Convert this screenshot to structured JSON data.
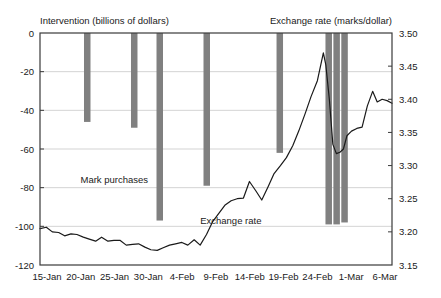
{
  "chart_data": {
    "type": "bar",
    "title": "",
    "left_axis": {
      "label": "Intervention (billions of dollars)",
      "ticks": [
        "0",
        "-20",
        "-40",
        "-60",
        "-80",
        "-100",
        "-120"
      ],
      "tick_values": [
        0,
        -20,
        -40,
        -60,
        -80,
        -100,
        -120
      ],
      "ylim": [
        -120,
        0
      ],
      "units": "billions of dollars"
    },
    "right_axis": {
      "label": "Exchange rate (marks/dollar)",
      "ticks": [
        "3.50",
        "3.45",
        "3.40",
        "3.35",
        "3.30",
        "3.25",
        "3.20",
        "3.15"
      ],
      "tick_values": [
        3.5,
        3.45,
        3.4,
        3.35,
        3.3,
        3.25,
        3.2,
        3.15
      ],
      "ylim": [
        3.15,
        3.5
      ],
      "units": "marks/dollar"
    },
    "xlabel": "",
    "x_ticks": [
      "15-Jan",
      "20-Jan",
      "25-Jan",
      "30-Jan",
      "4-Feb",
      "9-Feb",
      "14-Feb",
      "19-Feb",
      "24-Feb",
      "1-Mar",
      "6-Mar"
    ],
    "grid": true,
    "legend_position": "inline-annotations",
    "annotations": [
      {
        "text": "Mark purchases",
        "x_frac": 0.115,
        "y_frac": 0.645
      },
      {
        "text": "Exchange rate",
        "x_frac": 0.455,
        "y_frac": 0.825
      }
    ],
    "series": [
      {
        "name": "Mark purchases",
        "type": "bar",
        "axis": "left",
        "color": "#808080",
        "bars": [
          {
            "date": "19-Jan",
            "x_frac": 0.1335,
            "value": -46
          },
          {
            "date": "25-Jan",
            "x_frac": 0.267,
            "value": -49
          },
          {
            "date": "28-Jan",
            "x_frac": 0.3395,
            "value": -97
          },
          {
            "date": "3-Feb",
            "x_frac": 0.473,
            "value": -79
          },
          {
            "date": "18-Feb",
            "x_frac": 0.6805,
            "value": -62
          },
          {
            "date": "27-Feb",
            "x_frac": 0.8195,
            "value": -99
          },
          {
            "date": "28-Feb",
            "x_frac": 0.842,
            "value": -99
          },
          {
            "date": "1-Mar",
            "x_frac": 0.8645,
            "value": -98
          }
        ]
      },
      {
        "name": "Exchange rate",
        "type": "line",
        "axis": "right",
        "color": "#1a1a1a",
        "points": [
          {
            "x_frac": 0.0,
            "value": 3.205
          },
          {
            "x_frac": 0.018,
            "value": 3.207
          },
          {
            "x_frac": 0.035,
            "value": 3.2
          },
          {
            "x_frac": 0.053,
            "value": 3.199
          },
          {
            "x_frac": 0.07,
            "value": 3.194
          },
          {
            "x_frac": 0.088,
            "value": 3.197
          },
          {
            "x_frac": 0.105,
            "value": 3.196
          },
          {
            "x_frac": 0.123,
            "value": 3.192
          },
          {
            "x_frac": 0.14,
            "value": 3.189
          },
          {
            "x_frac": 0.158,
            "value": 3.186
          },
          {
            "x_frac": 0.175,
            "value": 3.192
          },
          {
            "x_frac": 0.193,
            "value": 3.186
          },
          {
            "x_frac": 0.21,
            "value": 3.187
          },
          {
            "x_frac": 0.228,
            "value": 3.187
          },
          {
            "x_frac": 0.245,
            "value": 3.18
          },
          {
            "x_frac": 0.263,
            "value": 3.181
          },
          {
            "x_frac": 0.28,
            "value": 3.182
          },
          {
            "x_frac": 0.298,
            "value": 3.177
          },
          {
            "x_frac": 0.315,
            "value": 3.173
          },
          {
            "x_frac": 0.333,
            "value": 3.172
          },
          {
            "x_frac": 0.35,
            "value": 3.176
          },
          {
            "x_frac": 0.368,
            "value": 3.18
          },
          {
            "x_frac": 0.385,
            "value": 3.182
          },
          {
            "x_frac": 0.403,
            "value": 3.184
          },
          {
            "x_frac": 0.42,
            "value": 3.18
          },
          {
            "x_frac": 0.438,
            "value": 3.188
          },
          {
            "x_frac": 0.455,
            "value": 3.18
          },
          {
            "x_frac": 0.473,
            "value": 3.196
          },
          {
            "x_frac": 0.49,
            "value": 3.215
          },
          {
            "x_frac": 0.508,
            "value": 3.228
          },
          {
            "x_frac": 0.525,
            "value": 3.24
          },
          {
            "x_frac": 0.543,
            "value": 3.247
          },
          {
            "x_frac": 0.56,
            "value": 3.25
          },
          {
            "x_frac": 0.578,
            "value": 3.251
          },
          {
            "x_frac": 0.595,
            "value": 3.276
          },
          {
            "x_frac": 0.613,
            "value": 3.262
          },
          {
            "x_frac": 0.63,
            "value": 3.248
          },
          {
            "x_frac": 0.648,
            "value": 3.268
          },
          {
            "x_frac": 0.665,
            "value": 3.288
          },
          {
            "x_frac": 0.683,
            "value": 3.3
          },
          {
            "x_frac": 0.7,
            "value": 3.312
          },
          {
            "x_frac": 0.718,
            "value": 3.33
          },
          {
            "x_frac": 0.735,
            "value": 3.352
          },
          {
            "x_frac": 0.753,
            "value": 3.378
          },
          {
            "x_frac": 0.77,
            "value": 3.404
          },
          {
            "x_frac": 0.788,
            "value": 3.428
          },
          {
            "x_frac": 0.805,
            "value": 3.47
          },
          {
            "x_frac": 0.812,
            "value": 3.452
          },
          {
            "x_frac": 0.822,
            "value": 3.4
          },
          {
            "x_frac": 0.832,
            "value": 3.332
          },
          {
            "x_frac": 0.842,
            "value": 3.318
          },
          {
            "x_frac": 0.852,
            "value": 3.32
          },
          {
            "x_frac": 0.862,
            "value": 3.325
          },
          {
            "x_frac": 0.872,
            "value": 3.345
          },
          {
            "x_frac": 0.885,
            "value": 3.352
          },
          {
            "x_frac": 0.9,
            "value": 3.356
          },
          {
            "x_frac": 0.915,
            "value": 3.358
          },
          {
            "x_frac": 0.93,
            "value": 3.39
          },
          {
            "x_frac": 0.945,
            "value": 3.412
          },
          {
            "x_frac": 0.958,
            "value": 3.396
          },
          {
            "x_frac": 0.972,
            "value": 3.4
          },
          {
            "x_frac": 0.986,
            "value": 3.398
          },
          {
            "x_frac": 1.0,
            "value": 3.394
          }
        ]
      }
    ]
  }
}
